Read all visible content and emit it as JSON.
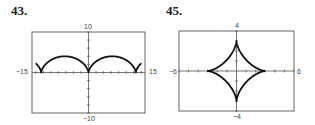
{
  "chart_data": [
    {
      "id": "43",
      "type": "line",
      "title": "43.",
      "description": "Cycloid arches (parametric), cusps on x-axis",
      "xlim": [
        -15,
        15
      ],
      "ylim": [
        -10,
        10
      ],
      "tick_labels": {
        "xmin": "−15",
        "xmax": "15",
        "ymax": "10",
        "ymin": "−10"
      },
      "x_tick_step": 2,
      "y_tick_step": 2,
      "grid": false,
      "series": [
        {
          "name": "curve",
          "param": "x = 2(t - sin t), y = 2(1 - cos t)",
          "cusps_x": [
            -12.57,
            0,
            12.57
          ],
          "peak_y": 4
        }
      ],
      "frame_px": {
        "left": 32,
        "top": 32,
        "right": 145,
        "bottom": 113
      }
    },
    {
      "id": "45",
      "type": "line",
      "title": "45.",
      "description": "Astroid (hypocycloid with four cusps)",
      "xlim": [
        -6,
        6
      ],
      "ylim": [
        -4,
        4
      ],
      "tick_labels": {
        "xmin": "−6",
        "xmax": "6",
        "ymax": "4",
        "ymin": "−4"
      },
      "x_tick_step": 1,
      "y_tick_step": 1,
      "grid": false,
      "series": [
        {
          "name": "curve",
          "param": "x = 3cos³t, y = 3sin³t",
          "cusps": [
            [
              3,
              0
            ],
            [
              0,
              3
            ],
            [
              -3,
              0
            ],
            [
              0,
              -3
            ]
          ]
        }
      ],
      "frame_px": {
        "left": 179,
        "top": 31,
        "right": 294,
        "bottom": 111
      }
    }
  ],
  "labels": {
    "p43": "43.",
    "p45": "45.",
    "g43": {
      "xmin": "−15",
      "xmax": "15",
      "ymax": "10",
      "ymin": "−10"
    },
    "g45": {
      "xmin": "−6",
      "xmax": "6",
      "ymax": "4",
      "ymin": "−4"
    }
  }
}
